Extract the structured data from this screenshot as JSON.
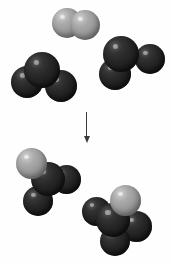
{
  "diagram": {
    "title": "Chemical reaction space-filling molecular model diagram",
    "type": "reaction-scheme",
    "canvas": {
      "width": 172,
      "height": 263,
      "background": "#fefefe"
    },
    "reaction_arrow": {
      "direction": "down",
      "label": "",
      "color": "#3a3a3a",
      "name": "reaction-arrow"
    },
    "atom_types": {
      "dark": {
        "label": "dark atom",
        "color": "#282828"
      },
      "light": {
        "label": "light gray atom",
        "color": "#9c9c9c"
      }
    },
    "reactants": [
      {
        "id": "reactant-diatomic",
        "label": "diatomic light molecule",
        "atom_count": 2,
        "atoms": [
          {
            "type": "light",
            "x": 52,
            "y": 8,
            "d": 30,
            "z": 1
          },
          {
            "type": "light",
            "x": 70,
            "y": 10,
            "d": 30,
            "z": 2
          }
        ]
      },
      {
        "id": "reactant-triatomic-left",
        "label": "triatomic dark molecule (left)",
        "atom_count": 3,
        "atoms": [
          {
            "type": "dark",
            "x": 11,
            "y": 66,
            "d": 32,
            "z": 1
          },
          {
            "type": "dark",
            "x": 24,
            "y": 52,
            "d": 36,
            "z": 3
          },
          {
            "type": "dark",
            "x": 45,
            "y": 70,
            "d": 32,
            "z": 2
          }
        ]
      },
      {
        "id": "reactant-triatomic-right",
        "label": "triatomic dark molecule (right)",
        "atom_count": 3,
        "atoms": [
          {
            "type": "dark",
            "x": 99,
            "y": 58,
            "d": 32,
            "z": 2
          },
          {
            "type": "dark",
            "x": 103,
            "y": 36,
            "d": 36,
            "z": 3
          },
          {
            "type": "dark",
            "x": 135,
            "y": 44,
            "d": 30,
            "z": 1
          }
        ]
      }
    ],
    "products": [
      {
        "id": "product-left",
        "label": "product molecule (left)",
        "atom_count": 4,
        "atoms": [
          {
            "type": "light",
            "x": 16,
            "y": 148,
            "d": 31,
            "z": 3
          },
          {
            "type": "dark",
            "x": 31,
            "y": 162,
            "d": 34,
            "z": 2
          },
          {
            "type": "dark",
            "x": 52,
            "y": 165,
            "d": 29,
            "z": 1
          },
          {
            "type": "dark",
            "x": 23,
            "y": 186,
            "d": 30,
            "z": 1
          }
        ]
      },
      {
        "id": "product-right",
        "label": "product molecule (right)",
        "atom_count": 4,
        "atoms": [
          {
            "type": "light",
            "x": 110,
            "y": 185,
            "d": 31,
            "z": 3
          },
          {
            "type": "dark",
            "x": 96,
            "y": 203,
            "d": 34,
            "z": 2
          },
          {
            "type": "dark",
            "x": 82,
            "y": 197,
            "d": 29,
            "z": 1
          },
          {
            "type": "dark",
            "x": 121,
            "y": 211,
            "d": 31,
            "z": 1
          },
          {
            "type": "dark",
            "x": 100,
            "y": 226,
            "d": 30,
            "z": 1
          }
        ]
      }
    ]
  }
}
